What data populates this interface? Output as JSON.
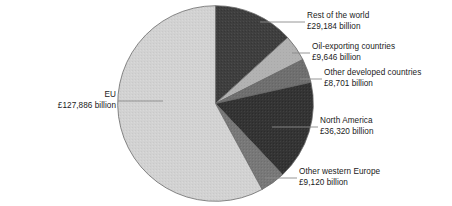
{
  "chart_data": {
    "type": "pie",
    "title": "",
    "subtitle": "",
    "xlabel": "",
    "ylabel": "",
    "unit": "£ billion",
    "total": 220857,
    "grid": false,
    "legend_position": "callout-labels",
    "start_angle_deg": 0,
    "direction": "clockwise",
    "categories": [
      "Rest of the world",
      "Oil-exporting countries",
      "Other developed countries",
      "North America",
      "Other western Europe",
      "EU"
    ],
    "values": [
      29184,
      9646,
      8701,
      36320,
      9120,
      127886
    ],
    "value_labels": [
      "£29,184 billion",
      "£9,646 billion",
      "£8,701 billion",
      "£36,320 billion",
      "£9,120 billion",
      "£127,886 billion"
    ],
    "percentages": [
      13.2,
      4.4,
      3.9,
      16.4,
      4.1,
      57.9
    ],
    "angles_deg": [
      47.6,
      15.7,
      14.2,
      59.2,
      14.9,
      208.5
    ],
    "slice_colors": [
      "#3f3f3f",
      "#b2b2b2",
      "#6f6f6f",
      "#343434",
      "#787878",
      "#d2d2d2"
    ],
    "slices": [
      {
        "name": "Rest of the world",
        "value": 29184,
        "value_label": "£29,184 billion",
        "percent": 13.2,
        "angle_deg": 47.6,
        "color": "#3f3f3f"
      },
      {
        "name": "Oil-exporting countries",
        "value": 9646,
        "value_label": "£9,646 billion",
        "percent": 4.4,
        "angle_deg": 15.7,
        "color": "#b2b2b2"
      },
      {
        "name": "Other developed countries",
        "value": 8701,
        "value_label": "£8,701 billion",
        "percent": 3.9,
        "angle_deg": 14.2,
        "color": "#6f6f6f"
      },
      {
        "name": "North America",
        "value": 36320,
        "value_label": "£36,320 billion",
        "percent": 16.4,
        "angle_deg": 59.2,
        "color": "#343434"
      },
      {
        "name": "Other western Europe",
        "value": 9120,
        "value_label": "£9,120 billion",
        "percent": 4.1,
        "angle_deg": 14.9,
        "color": "#787878"
      },
      {
        "name": "EU",
        "value": 127886,
        "value_label": "£127,886 billion",
        "percent": 57.9,
        "angle_deg": 208.5,
        "color": "#d2d2d2"
      }
    ]
  },
  "labels": {
    "rest_of_world": {
      "name": "Rest of the world",
      "value": "£29,184 billion"
    },
    "oil_exporting": {
      "name": "Oil-exporting countries",
      "value": "£9,646 billion"
    },
    "other_developed": {
      "name": "Other developed countries",
      "value": "£8,701 billion"
    },
    "north_america": {
      "name": "North America",
      "value": "£36,320 billion"
    },
    "other_western_europe": {
      "name": "Other western Europe",
      "value": "£9,120 billion"
    },
    "eu": {
      "name": "EU",
      "value": "£127,886 billion"
    }
  },
  "style": {
    "background": "#ffffff",
    "text_color": "#1a1a1a",
    "leader_line_color": "#8a8a8a",
    "slice_outline_color": "#6a6a6a"
  }
}
